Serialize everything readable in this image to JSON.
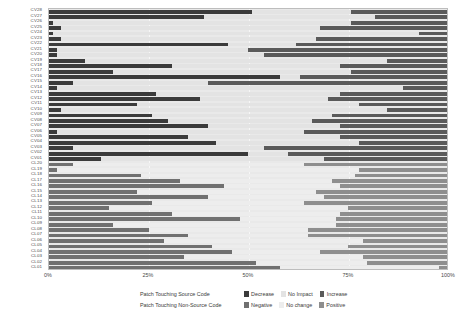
{
  "chart": {
    "type": "bar",
    "title": "",
    "xlabel": "",
    "ylabel": ""
  },
  "axis": {
    "x_ticks": [
      "0%",
      "25%",
      "50%",
      "75%",
      "100%"
    ],
    "x_tick_values": [
      0,
      25,
      50,
      75,
      100
    ],
    "xlim": [
      0,
      100
    ]
  },
  "legend": {
    "groups": [
      {
        "title": "Patch Touching Source Code",
        "keys": [
          {
            "label": "Decrease",
            "color": "#3b3b3b"
          },
          {
            "label": "No Impact",
            "color": "#e3e3e3"
          },
          {
            "label": "Increase",
            "color": "#5a5a5a"
          }
        ]
      },
      {
        "title": "Patch Touching Non-Source Code",
        "keys": [
          {
            "label": "Negative",
            "color": "#707070"
          },
          {
            "label": "No change",
            "color": "#ededed"
          },
          {
            "label": "Positive",
            "color": "#8e8e8e"
          }
        ]
      }
    ]
  },
  "colors": {
    "panel_background": "#e9e9e9",
    "panel_border": "#bdbdbd",
    "gridline": "#f7f7f7",
    "cv_decrease": "#3b3b3b",
    "cv_no_impact": "#e3e3e3",
    "cv_increase": "#5a5a5a",
    "cl_negative": "#707070",
    "cl_no_change": "#ededed",
    "cl_positive": "#8e8e8e",
    "text": "#4a4a4a"
  },
  "chart_data": {
    "type": "bar",
    "orientation": "horizontal",
    "stacked": true,
    "normalized_percent": true,
    "title": "",
    "xlabel": "",
    "ylabel": "",
    "xlim": [
      0,
      100
    ],
    "xticks": [
      0,
      25,
      50,
      75,
      100
    ],
    "xticklabels": [
      "0%",
      "25%",
      "50%",
      "75%",
      "100%"
    ],
    "grid": true,
    "legend_position": "bottom",
    "series_names_source": [
      "Decrease",
      "No Impact",
      "Increase"
    ],
    "series_names_nonsource": [
      "Negative",
      "No change",
      "Positive"
    ],
    "categories": [
      "CV28",
      "CV27",
      "CV26",
      "CV25",
      "CV24",
      "CV23",
      "CV22",
      "CV21",
      "CV20",
      "CV19",
      "CV18",
      "CV17",
      "CV16",
      "CV15",
      "CV14",
      "CV13",
      "CV12",
      "CV11",
      "CV10",
      "CV09",
      "CV08",
      "CV07",
      "CV06",
      "CV05",
      "CV04",
      "CV03",
      "CV02",
      "CV01",
      "CL20",
      "CL19",
      "CL18",
      "CL17",
      "CL16",
      "CL15",
      "CL14",
      "CL13",
      "CL12",
      "CL11",
      "CL10",
      "CL09",
      "CL08",
      "CL07",
      "CL06",
      "CL05",
      "CL04",
      "CL03",
      "CL02",
      "CL01"
    ],
    "rows": [
      {
        "label": "CV28",
        "group": "source",
        "neg": 51,
        "neu": 25,
        "pos": 24
      },
      {
        "label": "CV27",
        "group": "source",
        "neg": 39,
        "neu": 43,
        "pos": 18
      },
      {
        "label": "CV26",
        "group": "source",
        "neg": 1,
        "neu": 75,
        "pos": 24
      },
      {
        "label": "CV25",
        "group": "source",
        "neg": 3,
        "neu": 65,
        "pos": 32
      },
      {
        "label": "CV24",
        "group": "source",
        "neg": 1,
        "neu": 92,
        "pos": 7
      },
      {
        "label": "CV23",
        "group": "source",
        "neg": 3,
        "neu": 64,
        "pos": 33
      },
      {
        "label": "CV22",
        "group": "source",
        "neg": 45,
        "neu": 17,
        "pos": 38
      },
      {
        "label": "CV21",
        "group": "source",
        "neg": 2,
        "neu": 48,
        "pos": 50
      },
      {
        "label": "CV20",
        "group": "source",
        "neg": 2,
        "neu": 52,
        "pos": 46
      },
      {
        "label": "CV19",
        "group": "source",
        "neg": 9,
        "neu": 76,
        "pos": 15
      },
      {
        "label": "CV18",
        "group": "source",
        "neg": 31,
        "neu": 42,
        "pos": 27
      },
      {
        "label": "CV17",
        "group": "source",
        "neg": 16,
        "neu": 60,
        "pos": 24
      },
      {
        "label": "CV16",
        "group": "source",
        "neg": 58,
        "neu": 5,
        "pos": 37
      },
      {
        "label": "CV15",
        "group": "source",
        "neg": 6,
        "neu": 34,
        "pos": 60
      },
      {
        "label": "CV14",
        "group": "source",
        "neg": 2,
        "neu": 87,
        "pos": 11
      },
      {
        "label": "CV13",
        "group": "source",
        "neg": 27,
        "neu": 46,
        "pos": 27
      },
      {
        "label": "CV12",
        "group": "source",
        "neg": 38,
        "neu": 32,
        "pos": 30
      },
      {
        "label": "CV11",
        "group": "source",
        "neg": 22,
        "neu": 56,
        "pos": 22
      },
      {
        "label": "CV10",
        "group": "source",
        "neg": 3,
        "neu": 82,
        "pos": 15
      },
      {
        "label": "CV09",
        "group": "source",
        "neg": 26,
        "neu": 45,
        "pos": 29
      },
      {
        "label": "CV08",
        "group": "source",
        "neg": 30,
        "neu": 36,
        "pos": 34
      },
      {
        "label": "CV07",
        "group": "source",
        "neg": 40,
        "neu": 33,
        "pos": 27
      },
      {
        "label": "CV06",
        "group": "source",
        "neg": 2,
        "neu": 62,
        "pos": 36
      },
      {
        "label": "CV05",
        "group": "source",
        "neg": 35,
        "neu": 38,
        "pos": 27
      },
      {
        "label": "CV04",
        "group": "source",
        "neg": 42,
        "neu": 36,
        "pos": 22
      },
      {
        "label": "CV03",
        "group": "source",
        "neg": 6,
        "neu": 48,
        "pos": 46
      },
      {
        "label": "CV02",
        "group": "source",
        "neg": 50,
        "neu": 10,
        "pos": 40
      },
      {
        "label": "CV01",
        "group": "source",
        "neg": 13,
        "neu": 56,
        "pos": 31
      },
      {
        "label": "CL20",
        "group": "nonsource",
        "neg": 6,
        "neu": 58,
        "pos": 36
      },
      {
        "label": "CL19",
        "group": "nonsource",
        "neg": 2,
        "neu": 76,
        "pos": 22
      },
      {
        "label": "CL18",
        "group": "nonsource",
        "neg": 23,
        "neu": 54,
        "pos": 23
      },
      {
        "label": "CL17",
        "group": "nonsource",
        "neg": 33,
        "neu": 38,
        "pos": 29
      },
      {
        "label": "CL16",
        "group": "nonsource",
        "neg": 44,
        "neu": 29,
        "pos": 27
      },
      {
        "label": "CL15",
        "group": "nonsource",
        "neg": 22,
        "neu": 45,
        "pos": 33
      },
      {
        "label": "CL14",
        "group": "nonsource",
        "neg": 40,
        "neu": 29,
        "pos": 31
      },
      {
        "label": "CL13",
        "group": "nonsource",
        "neg": 26,
        "neu": 38,
        "pos": 36
      },
      {
        "label": "CL12",
        "group": "nonsource",
        "neg": 15,
        "neu": 60,
        "pos": 25
      },
      {
        "label": "CL11",
        "group": "nonsource",
        "neg": 31,
        "neu": 42,
        "pos": 27
      },
      {
        "label": "CL10",
        "group": "nonsource",
        "neg": 48,
        "neu": 24,
        "pos": 28
      },
      {
        "label": "CL09",
        "group": "nonsource",
        "neg": 16,
        "neu": 56,
        "pos": 28
      },
      {
        "label": "CL08",
        "group": "nonsource",
        "neg": 25,
        "neu": 40,
        "pos": 35
      },
      {
        "label": "CL07",
        "group": "nonsource",
        "neg": 35,
        "neu": 30,
        "pos": 35
      },
      {
        "label": "CL06",
        "group": "nonsource",
        "neg": 29,
        "neu": 50,
        "pos": 21
      },
      {
        "label": "CL05",
        "group": "nonsource",
        "neg": 41,
        "neu": 34,
        "pos": 25
      },
      {
        "label": "CL04",
        "group": "nonsource",
        "neg": 46,
        "neu": 22,
        "pos": 32
      },
      {
        "label": "CL03",
        "group": "nonsource",
        "neg": 34,
        "neu": 45,
        "pos": 21
      },
      {
        "label": "CL02",
        "group": "nonsource",
        "neg": 52,
        "neu": 28,
        "pos": 20
      },
      {
        "label": "CL01",
        "group": "nonsource",
        "neg": 58,
        "neu": 40,
        "pos": 2
      }
    ]
  }
}
